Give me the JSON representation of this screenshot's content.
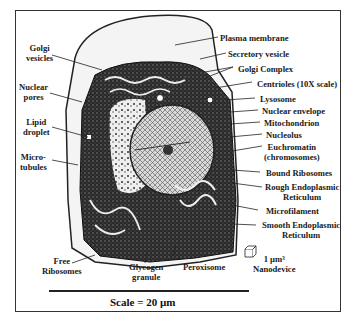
{
  "figure": {
    "scale_label": "Scale = 20 µm",
    "nanodevice": {
      "size": "1 µm³",
      "name": "Nanodevice"
    },
    "labels_left": [
      {
        "id": "golgi-vesicles",
        "lines": [
          "Golgi",
          "vesicles"
        ]
      },
      {
        "id": "nuclear-pores",
        "lines": [
          "Nuclear",
          "pores"
        ]
      },
      {
        "id": "lipid-droplet",
        "lines": [
          "Lipid",
          "droplet"
        ]
      },
      {
        "id": "microtubules",
        "lines": [
          "Micro-",
          "tubules"
        ]
      }
    ],
    "labels_right": [
      {
        "id": "plasma-membrane",
        "lines": [
          "Plasma membrane"
        ]
      },
      {
        "id": "secretory-vesicle",
        "lines": [
          "Secretory vesicle"
        ]
      },
      {
        "id": "golgi-complex",
        "lines": [
          "Golgi Complex"
        ]
      },
      {
        "id": "centrioles",
        "lines": [
          "Centrioles (10X scale)"
        ]
      },
      {
        "id": "lysosome",
        "lines": [
          "Lysosome"
        ]
      },
      {
        "id": "nuclear-envelope",
        "lines": [
          "Nuclear envelope"
        ]
      },
      {
        "id": "mitochondrion",
        "lines": [
          "Mitochondrion"
        ]
      },
      {
        "id": "nucleolus",
        "lines": [
          "Nucleolus"
        ]
      },
      {
        "id": "euchromatin",
        "lines": [
          "Euchromatin",
          "(chromosomes)"
        ]
      },
      {
        "id": "bound-ribosomes",
        "lines": [
          "Bound Ribosomes"
        ]
      },
      {
        "id": "rough-er",
        "lines": [
          "Rough Endoplasmic",
          "Reticulum"
        ]
      },
      {
        "id": "microfilament",
        "lines": [
          "Microfilament"
        ]
      },
      {
        "id": "smooth-er",
        "lines": [
          "Smooth Endoplasmic",
          "Reticulum"
        ]
      }
    ],
    "labels_bottom": [
      {
        "id": "free-ribosomes",
        "lines": [
          "Free",
          "Ribosomes"
        ]
      },
      {
        "id": "glycogen-granule",
        "lines": [
          "Glycogen",
          "granule"
        ]
      },
      {
        "id": "peroxisome",
        "lines": [
          "Peroxisome"
        ]
      }
    ]
  }
}
